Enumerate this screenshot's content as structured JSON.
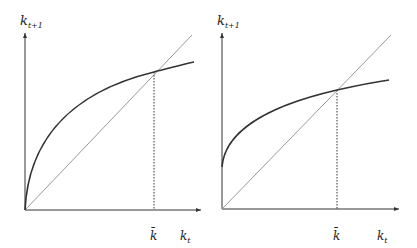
{
  "panels": [
    {
      "name": "left",
      "y_label": "k",
      "y_label_sub": "t+1",
      "x_label": "k",
      "x_label_sub": "t",
      "steady_state_label": "k̄",
      "curve": "concave, starts at origin"
    },
    {
      "name": "right",
      "y_label": "k",
      "y_label_sub": "t+1",
      "x_label": "k",
      "x_label_sub": "t",
      "steady_state_label": "k̄",
      "curve": "concave, positive intercept"
    }
  ],
  "colors": {
    "axis": "#333333",
    "curve": "#333333",
    "diagonal": "#999999",
    "dotted": "#333333"
  }
}
